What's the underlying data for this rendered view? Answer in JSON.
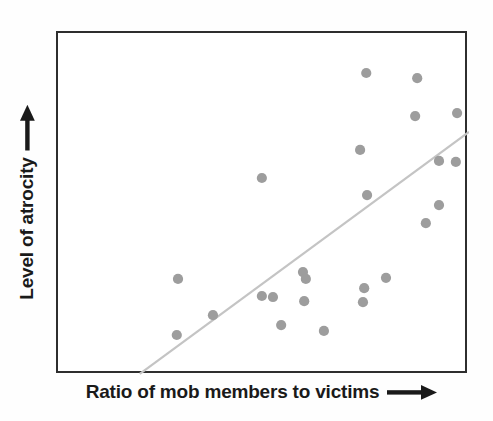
{
  "chart_data": {
    "type": "scatter",
    "title": "",
    "xlabel": "Ratio of mob members to victims",
    "ylabel": "Level of atrocity",
    "xlabel_arrow": "right-arrow",
    "ylabel_arrow": "up-arrow",
    "grid": false,
    "legend": null,
    "axis_ticks": false,
    "axis_tick_labels": [],
    "xlim": [
      0,
      100
    ],
    "ylim": [
      0,
      100
    ],
    "point_color": "#9d9d9d",
    "line_color": "#c4c4c4",
    "frame_color": "#2e2e2e",
    "text_color": "#1a1a1a",
    "points": [
      {
        "x": 75.0,
        "y": 88.3
      },
      {
        "x": 87.4,
        "y": 86.8
      },
      {
        "x": 86.9,
        "y": 75.7
      },
      {
        "x": 97.1,
        "y": 76.6
      },
      {
        "x": 96.8,
        "y": 62.3
      },
      {
        "x": 73.5,
        "y": 65.8
      },
      {
        "x": 92.7,
        "y": 62.6
      },
      {
        "x": 49.6,
        "y": 57.6
      },
      {
        "x": 75.2,
        "y": 52.6
      },
      {
        "x": 92.7,
        "y": 49.7
      },
      {
        "x": 89.5,
        "y": 44.4
      },
      {
        "x": 29.2,
        "y": 28.1
      },
      {
        "x": 59.6,
        "y": 30.1
      },
      {
        "x": 60.3,
        "y": 28.1
      },
      {
        "x": 59.9,
        "y": 21.6
      },
      {
        "x": 49.6,
        "y": 23.1
      },
      {
        "x": 52.3,
        "y": 22.8
      },
      {
        "x": 74.5,
        "y": 25.4
      },
      {
        "x": 79.8,
        "y": 28.4
      },
      {
        "x": 37.7,
        "y": 17.5
      },
      {
        "x": 74.2,
        "y": 21.3
      },
      {
        "x": 54.3,
        "y": 14.6
      },
      {
        "x": 64.7,
        "y": 12.9
      },
      {
        "x": 28.9,
        "y": 11.7
      }
    ],
    "trendline": {
      "x0": 19.9,
      "y0": 0.3,
      "x1": 100.0,
      "y1": 71.1
    }
  },
  "figure": {
    "background": "#ffffff"
  }
}
